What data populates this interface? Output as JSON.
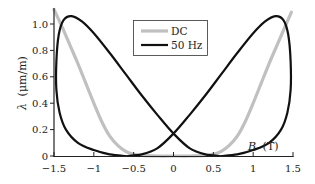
{
  "chart_data": {
    "type": "line",
    "title": "",
    "xlabel_var": "B",
    "xlabel_unit": "(T)",
    "ylabel_var": "λ",
    "ylabel_unit": "(μm/m)",
    "xlim": [
      -1.5,
      1.5
    ],
    "ylim": [
      0,
      1.1
    ],
    "x_ticks": [
      -1.5,
      -1,
      -0.5,
      0,
      0.5,
      1,
      1.5
    ],
    "x_tick_labels": [
      "−1.5",
      "−1",
      "−0.5",
      "0",
      "0.5",
      "1",
      "1.5"
    ],
    "y_ticks": [
      0,
      0.2,
      0.4,
      0.6,
      0.8,
      1.0
    ],
    "y_tick_labels": [
      "0",
      "0.2",
      "0.4",
      "0.6",
      "0.8",
      "1.0"
    ],
    "grid": false,
    "legend_position": "upper center",
    "series": [
      {
        "name": "DC",
        "color": "#c0c0c0",
        "width": 3.2,
        "points": [
          [
            -1.5,
            1.11
          ],
          [
            -1.4,
            0.98
          ],
          [
            -1.3,
            0.84
          ],
          [
            -1.2,
            0.7
          ],
          [
            -1.1,
            0.55
          ],
          [
            -1.0,
            0.4
          ],
          [
            -0.9,
            0.26
          ],
          [
            -0.8,
            0.15
          ],
          [
            -0.7,
            0.08
          ],
          [
            -0.6,
            0.035
          ],
          [
            -0.5,
            0.012
          ],
          [
            -0.4,
            0.004
          ],
          [
            -0.2,
            0.0
          ],
          [
            0.0,
            0.0
          ],
          [
            0.2,
            0.0
          ],
          [
            0.4,
            0.004
          ],
          [
            0.5,
            0.012
          ],
          [
            0.6,
            0.035
          ],
          [
            0.7,
            0.08
          ],
          [
            0.8,
            0.15
          ],
          [
            0.9,
            0.26
          ],
          [
            1.0,
            0.4
          ],
          [
            1.1,
            0.55
          ],
          [
            1.2,
            0.7
          ],
          [
            1.3,
            0.84
          ],
          [
            1.4,
            0.98
          ],
          [
            1.48,
            1.09
          ]
        ]
      },
      {
        "name": "50 Hz",
        "color": "#111111",
        "width": 2.2,
        "points_branch_1": [
          [
            -1.47,
            0.0
          ],
          [
            -1.5,
            0.0
          ]
        ],
        "branch_a": [
          [
            0.58,
            0.0
          ],
          [
            0.4,
            0.012
          ],
          [
            0.2,
            0.06
          ],
          [
            0.0,
            0.17
          ],
          [
            -0.2,
            0.31
          ],
          [
            -0.4,
            0.46
          ],
          [
            -0.6,
            0.62
          ],
          [
            -0.8,
            0.78
          ],
          [
            -1.0,
            0.93
          ],
          [
            -1.15,
            1.02
          ],
          [
            -1.28,
            1.06
          ],
          [
            -1.38,
            1.03
          ],
          [
            -1.44,
            0.92
          ],
          [
            -1.47,
            0.72
          ],
          [
            -1.47,
            0.5
          ],
          [
            -1.43,
            0.33
          ],
          [
            -1.35,
            0.2
          ],
          [
            -1.2,
            0.1
          ],
          [
            -1.0,
            0.045
          ],
          [
            -0.8,
            0.012
          ],
          [
            -0.6,
            0.0
          ]
        ],
        "branch_b": [
          [
            -0.58,
            0.0
          ],
          [
            -0.4,
            0.012
          ],
          [
            -0.2,
            0.06
          ],
          [
            0.0,
            0.17
          ],
          [
            0.2,
            0.31
          ],
          [
            0.4,
            0.46
          ],
          [
            0.6,
            0.62
          ],
          [
            0.8,
            0.78
          ],
          [
            1.0,
            0.93
          ],
          [
            1.15,
            1.02
          ],
          [
            1.28,
            1.06
          ],
          [
            1.38,
            1.03
          ],
          [
            1.44,
            0.92
          ],
          [
            1.47,
            0.72
          ],
          [
            1.47,
            0.5
          ],
          [
            1.43,
            0.33
          ],
          [
            1.35,
            0.2
          ],
          [
            1.2,
            0.1
          ],
          [
            1.0,
            0.045
          ],
          [
            0.8,
            0.012
          ],
          [
            0.6,
            0.0
          ]
        ]
      }
    ],
    "legend": [
      {
        "label": "DC",
        "color": "#c0c0c0"
      },
      {
        "label": "50 Hz",
        "color": "#111111"
      }
    ]
  }
}
